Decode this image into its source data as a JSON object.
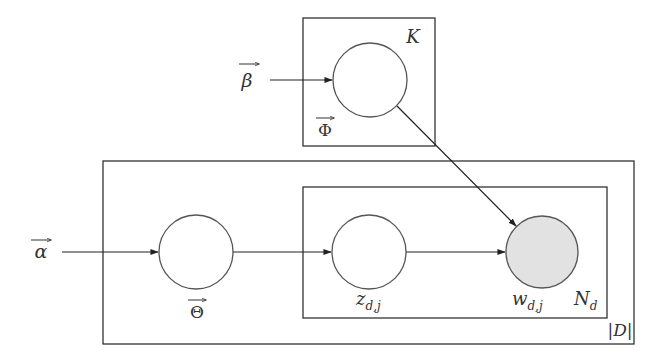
{
  "diagram": {
    "type": "plate-notation graphical model",
    "colors": {
      "stroke": "#333333",
      "observed_fill": "#e2e2e2",
      "latent_fill": "#ffffff",
      "background": "#ffffff"
    },
    "plates": [
      {
        "id": "K",
        "label": "K",
        "x": 303,
        "y": 18,
        "w": 132,
        "h": 128
      },
      {
        "id": "D",
        "label": "|D|",
        "x": 103,
        "y": 161,
        "w": 531,
        "h": 183
      },
      {
        "id": "N",
        "label": "N",
        "label_sub": "d",
        "x": 303,
        "y": 187,
        "w": 304,
        "h": 131
      }
    ],
    "nodes": [
      {
        "id": "phi",
        "label": "Φ",
        "vector": true,
        "cx": 370,
        "cy": 80,
        "r": 37,
        "observed": false
      },
      {
        "id": "theta",
        "label": "Θ",
        "vector": true,
        "cx": 196,
        "cy": 252,
        "r": 37,
        "observed": false
      },
      {
        "id": "z",
        "label": "z",
        "label_sub": "d,j",
        "cx": 369,
        "cy": 252,
        "r": 37,
        "observed": false
      },
      {
        "id": "w",
        "label": "w",
        "label_sub": "d,j",
        "cx": 542,
        "cy": 252,
        "r": 36,
        "observed": true
      }
    ],
    "hyperparameters": [
      {
        "id": "alpha",
        "label": "α",
        "vector": true,
        "x": 40,
        "y": 252
      },
      {
        "id": "beta",
        "label": "β",
        "vector": true,
        "x": 247,
        "y": 80
      }
    ],
    "edges": [
      {
        "from": "alpha",
        "to": "theta"
      },
      {
        "from": "beta",
        "to": "phi"
      },
      {
        "from": "theta",
        "to": "z"
      },
      {
        "from": "z",
        "to": "w"
      },
      {
        "from": "phi",
        "to": "w"
      }
    ],
    "labels": {
      "K": "K",
      "D": "|D|",
      "N": "N",
      "N_sub": "d",
      "phi": "Φ",
      "theta": "Θ",
      "alpha": "α",
      "beta": "β",
      "z": "z",
      "z_sub": "d,j",
      "w": "w",
      "w_sub": "d,j"
    }
  }
}
